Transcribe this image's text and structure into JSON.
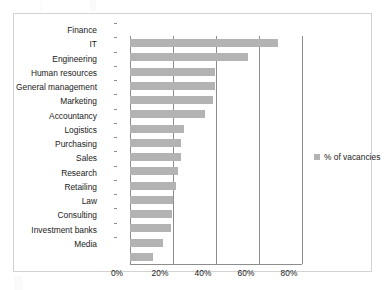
{
  "chart_data": {
    "type": "bar",
    "orientation": "horizontal",
    "title": "",
    "subtitle": "",
    "xlabel": "",
    "ylabel": "",
    "xlim": [
      0,
      80
    ],
    "xtick_labels": [
      "0%",
      "20%",
      "40%",
      "60%",
      "80%"
    ],
    "xticks": [
      0,
      20,
      40,
      60,
      80
    ],
    "grid": "vertical",
    "legend_position": "right",
    "series_name": "% of vacancies",
    "bar_color": "#b3b3b3",
    "axis_color": "#8d8d8d",
    "categories": [
      "Finance",
      "IT",
      "Engineering",
      "Human resources",
      "General management",
      "Marketing",
      "Accountancy",
      "Logistics",
      "Purchasing",
      "Sales",
      "Research",
      "Retailing",
      "Law",
      "Consulting",
      "Investment banks",
      "Media"
    ],
    "values": [
      69,
      55,
      39.5,
      39.5,
      38.5,
      35,
      25,
      23.5,
      23.5,
      22.5,
      21.5,
      20,
      19.5,
      19,
      15.5,
      10.5
    ],
    "series": [
      {
        "name": "% of vacancies",
        "values": [
          69,
          55,
          39.5,
          39.5,
          38.5,
          35,
          25,
          23.5,
          23.5,
          22.5,
          21.5,
          20,
          19.5,
          19,
          15.5,
          10.5
        ]
      }
    ]
  },
  "legend": {
    "entries": [
      {
        "label": "% of vacancies",
        "color": "#b3b3b3"
      }
    ]
  }
}
